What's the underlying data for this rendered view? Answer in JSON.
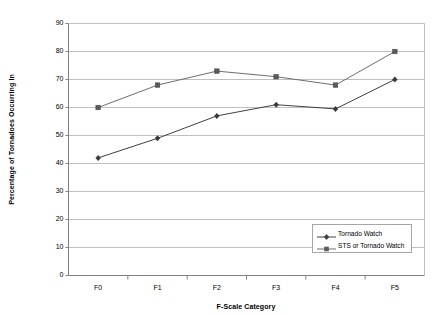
{
  "chart_data": {
    "type": "line",
    "title": "",
    "xlabel": "F-Scale Category",
    "ylabel": "Percentage of Tornadoes Occurring In",
    "categories": [
      "F0",
      "F1",
      "F2",
      "F3",
      "F4",
      "F5"
    ],
    "ylim": [
      0,
      90
    ],
    "yticks": [
      0,
      10,
      20,
      30,
      40,
      50,
      60,
      70,
      80,
      90
    ],
    "ytick_labels": [
      "0",
      "10",
      "20",
      "30",
      "40",
      "50",
      "60",
      "70",
      "80",
      "90"
    ],
    "grid": "horizontal",
    "legend_position": "inside-lower-right",
    "series": [
      {
        "name": "Tornado Watch",
        "marker": "diamond",
        "color": "#404040",
        "values": [
          42,
          49,
          57,
          61,
          59.5,
          70
        ]
      },
      {
        "name": "STS or Tornado Watch",
        "marker": "square",
        "color": "#6e6e6e",
        "values": [
          60,
          68,
          73,
          71,
          68,
          80
        ]
      }
    ]
  },
  "axes": {
    "x_title": "F-Scale Category",
    "y_title": "Percentage of Tornadoes Occurring In"
  },
  "legend": {
    "items": [
      {
        "label": "Tornado Watch"
      },
      {
        "label": "STS or Tornado Watch"
      }
    ]
  },
  "colors": {
    "series_1": "#404040",
    "series_2": "#6e6e6e",
    "grid": "#bfbfbf",
    "axis": "#808080",
    "legend_border": "#a6a6a6",
    "background": "#ffffff"
  }
}
